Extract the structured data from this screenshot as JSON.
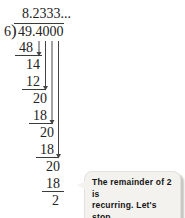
{
  "division": {
    "quotient": "8.2333...",
    "divisor": "6",
    "bracket": ")",
    "dividend": "49.4000",
    "rows": [
      "48",
      "14",
      "12",
      "20",
      "18",
      "20",
      "18",
      "20",
      "18",
      "2"
    ]
  },
  "callout": {
    "line1": "The remainder of 2 is",
    "line2": "recurring. Let's stop."
  },
  "colors": {
    "ink": "#222222",
    "line": "#3a3a3a",
    "bubble_fill": "#f3f2ef",
    "bubble_shadow": "#c8c6c2",
    "background": "#ffffff"
  }
}
